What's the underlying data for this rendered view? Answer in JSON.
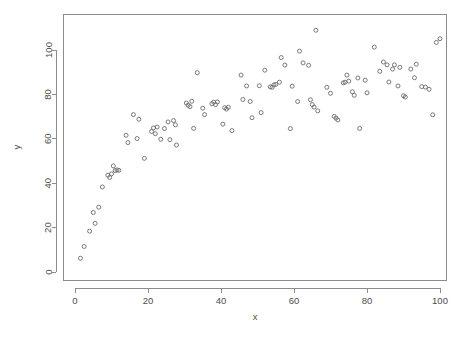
{
  "chart_data": {
    "type": "scatter",
    "title": "",
    "subtitle": "",
    "xlabel": "x",
    "ylabel": "y",
    "xlim": [
      -1.5,
      103
    ],
    "ylim": [
      -2,
      112
    ],
    "xticks": [
      0,
      20,
      40,
      60,
      80,
      100
    ],
    "yticks": [
      0,
      20,
      40,
      60,
      80,
      100
    ],
    "xtick_labels": [
      "0",
      "20",
      "40",
      "60",
      "80",
      "100"
    ],
    "ytick_labels": [
      "0",
      "20",
      "40",
      "60",
      "80",
      "100"
    ],
    "grid": false,
    "legend": null,
    "legend_position": "none",
    "marker": "open-circle",
    "marker_color": "#6b6b6b",
    "marker_size": 4,
    "frame_color": "#8c8c8c",
    "background_color": "#ffffff",
    "n_points": 100,
    "series": [
      {
        "name": "observations",
        "points": [
          [
            1.5,
            6.2
          ],
          [
            2.5,
            11.5
          ],
          [
            4.0,
            18.4
          ],
          [
            5.0,
            26.8
          ],
          [
            5.5,
            21.9
          ],
          [
            6.5,
            29.2
          ],
          [
            7.5,
            38.3
          ],
          [
            9.0,
            43.6
          ],
          [
            9.5,
            42.6
          ],
          [
            10.0,
            44.2
          ],
          [
            10.5,
            47.8
          ],
          [
            11.0,
            45.7
          ],
          [
            11.5,
            46.0
          ],
          [
            12.0,
            45.8
          ],
          [
            14.0,
            61.6
          ],
          [
            14.5,
            58.3
          ],
          [
            16.0,
            70.9
          ],
          [
            17.0,
            60.1
          ],
          [
            17.5,
            68.8
          ],
          [
            19.0,
            51.2
          ],
          [
            21.0,
            63.3
          ],
          [
            21.5,
            64.9
          ],
          [
            22.0,
            62.3
          ],
          [
            22.5,
            65.3
          ],
          [
            23.5,
            59.8
          ],
          [
            24.5,
            64.6
          ],
          [
            25.5,
            67.6
          ],
          [
            26.0,
            59.6
          ],
          [
            27.0,
            68.2
          ],
          [
            27.5,
            66.3
          ],
          [
            27.8,
            57.2
          ],
          [
            30.5,
            76.1
          ],
          [
            31.0,
            75.1
          ],
          [
            31.5,
            74.5
          ],
          [
            32.0,
            76.9
          ],
          [
            32.5,
            64.7
          ],
          [
            33.5,
            89.8
          ],
          [
            35.0,
            73.8
          ],
          [
            35.5,
            70.9
          ],
          [
            37.5,
            75.8
          ],
          [
            38.0,
            76.5
          ],
          [
            38.5,
            75.4
          ],
          [
            39.0,
            76.6
          ],
          [
            40.5,
            66.6
          ],
          [
            41.0,
            74.0
          ],
          [
            41.5,
            73.4
          ],
          [
            42.0,
            74.2
          ],
          [
            43.0,
            63.7
          ],
          [
            45.5,
            88.7
          ],
          [
            46.0,
            77.7
          ],
          [
            47.0,
            83.8
          ],
          [
            48.0,
            76.8
          ],
          [
            48.5,
            69.5
          ],
          [
            50.5,
            83.9
          ],
          [
            51.0,
            71.8
          ],
          [
            52.0,
            90.9
          ],
          [
            53.5,
            83.4
          ],
          [
            54.0,
            83.2
          ],
          [
            54.5,
            84.3
          ],
          [
            55.0,
            84.5
          ],
          [
            56.0,
            85.5
          ],
          [
            56.5,
            96.6
          ],
          [
            57.5,
            93.2
          ],
          [
            59.0,
            64.6
          ],
          [
            59.5,
            83.7
          ],
          [
            61.0,
            76.8
          ],
          [
            61.5,
            99.5
          ],
          [
            62.5,
            94.2
          ],
          [
            64.0,
            93.1
          ],
          [
            64.5,
            77.6
          ],
          [
            65.0,
            75.4
          ],
          [
            65.5,
            74.3
          ],
          [
            66.0,
            108.9
          ],
          [
            66.5,
            72.6
          ],
          [
            69.0,
            83.2
          ],
          [
            70.0,
            80.5
          ],
          [
            71.0,
            70.1
          ],
          [
            71.5,
            69.3
          ],
          [
            72.0,
            68.5
          ],
          [
            73.5,
            85.2
          ],
          [
            74.0,
            85.5
          ],
          [
            74.5,
            88.7
          ],
          [
            75.0,
            86.0
          ],
          [
            76.0,
            81.2
          ],
          [
            76.5,
            79.6
          ],
          [
            77.5,
            87.4
          ],
          [
            78.0,
            64.7
          ],
          [
            79.5,
            86.4
          ],
          [
            80.0,
            80.7
          ],
          [
            82.0,
            101.3
          ],
          [
            83.5,
            90.4
          ],
          [
            84.5,
            94.6
          ],
          [
            85.5,
            93.3
          ],
          [
            86.0,
            85.6
          ],
          [
            87.0,
            91.4
          ],
          [
            87.5,
            93.3
          ],
          [
            88.5,
            83.8
          ],
          [
            89.0,
            92.2
          ],
          [
            90.0,
            79.4
          ],
          [
            90.5,
            78.8
          ],
          [
            92.0,
            91.4
          ],
          [
            93.0,
            87.5
          ],
          [
            93.5,
            93.6
          ],
          [
            95.0,
            83.5
          ],
          [
            96.0,
            83.3
          ],
          [
            97.0,
            82.3
          ],
          [
            98.0,
            70.8
          ],
          [
            99.0,
            103.4
          ],
          [
            100.0,
            105.1
          ]
        ]
      }
    ]
  }
}
